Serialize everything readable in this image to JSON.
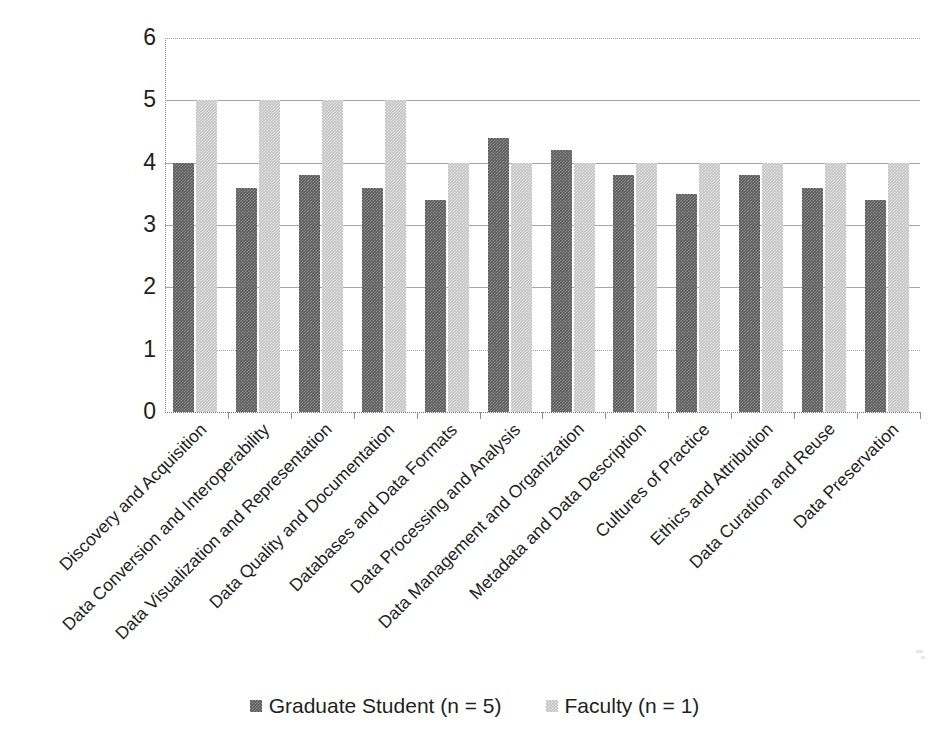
{
  "chart_data": {
    "type": "bar",
    "title": "",
    "xlabel": "",
    "ylabel": "",
    "ylim": [
      0,
      6
    ],
    "ytick_step": 1,
    "yticks": [
      "6",
      "5",
      "4",
      "3",
      "2",
      "1",
      "0"
    ],
    "grid": true,
    "legend_position": "bottom",
    "categories": [
      "Discovery and Acquisition",
      "Data Conversion and Interoperability",
      "Data Visualization and Representation",
      "Data Quality and Documentation",
      "Databases and Data Formats",
      "Data Processing and Analysis",
      "Data Management and Organization",
      "Metadata and Data Description",
      "Cultures of Practice",
      "Ethics and Attribution",
      "Data Curation and Reuse",
      "Data Preservation"
    ],
    "series": [
      {
        "name": "Graduate Student (n = 5)",
        "color": "#595959",
        "values": [
          4.0,
          3.6,
          3.8,
          3.6,
          3.4,
          4.4,
          4.2,
          3.8,
          3.5,
          3.8,
          3.6,
          3.4
        ]
      },
      {
        "name": "Faculty (n = 1)",
        "color": "#c2c2c2",
        "values": [
          5.0,
          5.0,
          5.0,
          5.0,
          4.0,
          4.0,
          4.0,
          4.0,
          4.0,
          4.0,
          4.0,
          4.0
        ]
      }
    ]
  },
  "legend": {
    "items": [
      {
        "label": "Graduate Student (n = 5)",
        "swatch": "dark"
      },
      {
        "label": "Faculty (n = 1)",
        "swatch": "light"
      }
    ]
  },
  "caption": {
    "text": ""
  }
}
